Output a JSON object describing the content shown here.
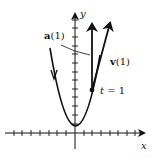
{
  "diagram": {
    "axes": {
      "x_label": "x",
      "y_label": "y"
    },
    "labels": {
      "acceleration": "a(1)",
      "acceleration_bold": "a",
      "acceleration_arg": "(1)",
      "velocity": "v(1)",
      "velocity_bold": "v",
      "velocity_arg": "(1)",
      "point": "t = 1",
      "point_var": "t",
      "point_eq": " = 1"
    },
    "colors": {
      "ink": "#111111",
      "background": "#ffffff"
    }
  }
}
